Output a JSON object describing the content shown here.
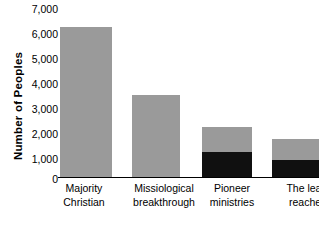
{
  "chart_data": {
    "type": "bar",
    "title": "",
    "xlabel": "",
    "ylabel": "Number of Peoples",
    "ylim": [
      0,
      7000
    ],
    "ytick_labels": [
      "7,000",
      "6,000",
      "5,000",
      "4,000",
      "3,000",
      "2,000",
      "1,000",
      "0"
    ],
    "ytick_values": [
      7000,
      6000,
      5000,
      4000,
      3000,
      2000,
      1000,
      0
    ],
    "grid": false,
    "legend": "none",
    "stacked": true,
    "categories": [
      [
        "Majority",
        "Christian"
      ],
      [
        "Missiological",
        "breakthrough"
      ],
      [
        "Pioneer",
        "ministries"
      ],
      [
        "The least",
        "reached"
      ]
    ],
    "category_labels": [
      "Majority Christian",
      "Missiological breakthrough",
      "Pioneer ministries",
      "The least reached"
    ],
    "series": [
      {
        "name": "upper-segment",
        "color": "#9a9a9a",
        "values": [
          6000,
          3300,
          1000,
          820
        ]
      },
      {
        "name": "lower-segment",
        "color": "#101010",
        "values": [
          0,
          0,
          1000,
          700
        ]
      }
    ],
    "totals": [
      6000,
      3300,
      2000,
      1520
    ],
    "colors": {
      "gray": "#9a9a9a",
      "black": "#101010",
      "axis": "#000000",
      "background": "#ffffff"
    }
  },
  "layout": {
    "bar_left_px": [
      2,
      74,
      144,
      214
    ],
    "bar_width_px": [
      52,
      48,
      50,
      48
    ],
    "cat_left_px": [
      -12,
      58,
      134,
      204
    ],
    "cat_width_px": [
      76,
      96,
      80,
      92
    ],
    "tick_top_px": [
      4,
      29,
      54,
      79,
      104,
      129,
      154,
      174
    ],
    "px_per_1000": 25,
    "baseline_top_px": 178
  }
}
